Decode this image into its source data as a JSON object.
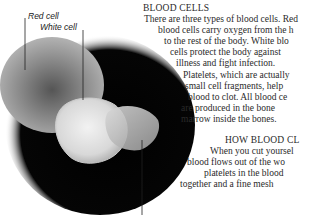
{
  "illustration": {
    "description": "micrograph of red blood cell, white blood cell and platelet",
    "labels": {
      "red_cell": "Red cell",
      "white_cell": "White cell"
    }
  },
  "section1": {
    "heading": "BLOOD CELLS",
    "lines": [
      "There are three types of blood cells. Red",
      "blood cells carry oxygen from the h",
      "to the rest of the body. White blo",
      "cells protect the body against",
      "illness and fight infection.",
      "Platelets, which are actually",
      "small cell fragments, help",
      "blood to clot. All blood ce",
      "are produced in the bone",
      "marrow inside the bones."
    ]
  },
  "section2": {
    "heading": "HOW BLOOD CL",
    "lines": [
      "When you cut yoursel",
      "blood flows out of the wo",
      "platelets in the blood",
      "together and a fine mesh"
    ]
  }
}
